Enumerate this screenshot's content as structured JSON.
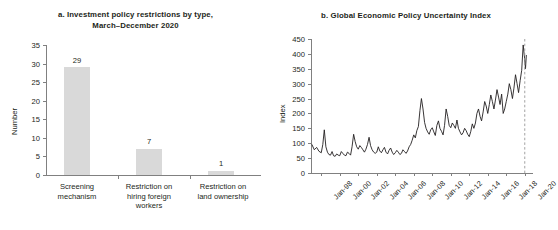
{
  "figure": {
    "panel_a": {
      "title_line1": "a. Investment policy restrictions by type,",
      "title_line2": "March–December 2020"
    },
    "panel_b": {
      "title": "b. Global Economic Policy Uncertainty Index"
    }
  },
  "chart_data": [
    {
      "type": "bar",
      "panel": "a",
      "title": "a. Investment policy restrictions by type, March–December 2020",
      "xlabel": "",
      "ylabel": "Number",
      "ylim": [
        0,
        35
      ],
      "yticks": [
        0,
        5,
        10,
        15,
        20,
        25,
        30,
        35
      ],
      "grid": false,
      "bar_color": "#d9d9d9",
      "categories": [
        [
          "Screening",
          "mechanism"
        ],
        [
          "Restriction on",
          "hiring foreign",
          "workers"
        ],
        [
          "Restriction on",
          "land ownership"
        ]
      ],
      "category_labels": [
        "Screening mechanism",
        "Restriction on hiring foreign workers",
        "Restriction on land ownership"
      ],
      "values": [
        29,
        7,
        1
      ],
      "value_labels": [
        "29",
        "7",
        "1"
      ]
    },
    {
      "type": "line",
      "panel": "b",
      "title": "b. Global Economic Policy Uncertainty Index",
      "xlabel": "",
      "ylabel": "Index",
      "ylim": [
        0,
        450
      ],
      "yticks": [
        0,
        50,
        100,
        150,
        200,
        250,
        300,
        350,
        400,
        450
      ],
      "xticks": [
        "Jan-98",
        "Jan-00",
        "Jan-02",
        "Jan-04",
        "Jan-06",
        "Jan-08",
        "Jan-10",
        "Jan-12",
        "Jan-14",
        "Jan-16",
        "Jan-18",
        "Jan-20"
      ],
      "xlim": [
        "Jan-97",
        "Jan-21"
      ],
      "grid": false,
      "line_color": "#231f20",
      "marker_line": {
        "x": "Jan-20",
        "style": "dashed",
        "color": "#999999"
      },
      "x": [
        1997.0,
        1997.25,
        1997.5,
        1997.75,
        1998.0,
        1998.17,
        1998.33,
        1998.5,
        1998.67,
        1998.83,
        1999.0,
        1999.17,
        1999.33,
        1999.5,
        1999.67,
        1999.83,
        2000.0,
        2000.17,
        2000.33,
        2000.5,
        2000.67,
        2000.83,
        2001.0,
        2001.17,
        2001.33,
        2001.5,
        2001.67,
        2001.83,
        2002.0,
        2002.17,
        2002.33,
        2002.5,
        2002.67,
        2002.83,
        2003.0,
        2003.17,
        2003.33,
        2003.5,
        2003.67,
        2003.83,
        2004.0,
        2004.17,
        2004.33,
        2004.5,
        2004.67,
        2004.83,
        2005.0,
        2005.17,
        2005.33,
        2005.5,
        2005.67,
        2005.83,
        2006.0,
        2006.17,
        2006.33,
        2006.5,
        2006.67,
        2006.83,
        2007.0,
        2007.17,
        2007.33,
        2007.5,
        2007.67,
        2007.83,
        2008.0,
        2008.17,
        2008.33,
        2008.5,
        2008.67,
        2008.83,
        2009.0,
        2009.17,
        2009.33,
        2009.5,
        2009.67,
        2009.83,
        2010.0,
        2010.17,
        2010.33,
        2010.5,
        2010.67,
        2010.83,
        2011.0,
        2011.17,
        2011.33,
        2011.5,
        2011.67,
        2011.83,
        2012.0,
        2012.17,
        2012.33,
        2012.5,
        2012.67,
        2012.83,
        2013.0,
        2013.17,
        2013.33,
        2013.5,
        2013.67,
        2013.83,
        2014.0,
        2014.17,
        2014.33,
        2014.5,
        2014.67,
        2014.83,
        2015.0,
        2015.17,
        2015.33,
        2015.5,
        2015.67,
        2015.83,
        2016.0,
        2016.17,
        2016.33,
        2016.5,
        2016.67,
        2016.83,
        2017.0,
        2017.17,
        2017.33,
        2017.5,
        2017.67,
        2017.83,
        2018.0,
        2018.17,
        2018.33,
        2018.5,
        2018.67,
        2018.83,
        2019.0,
        2019.17,
        2019.33,
        2019.5,
        2019.67,
        2019.83,
        2020.0,
        2020.08,
        2020.17,
        2020.25,
        2020.33,
        2020.42,
        2020.5
      ],
      "y": [
        95,
        78,
        86,
        73,
        68,
        96,
        145,
        88,
        70,
        62,
        60,
        72,
        58,
        56,
        64,
        60,
        58,
        72,
        66,
        60,
        58,
        70,
        66,
        60,
        88,
        130,
        105,
        88,
        80,
        92,
        86,
        78,
        70,
        80,
        96,
        120,
        92,
        78,
        70,
        66,
        70,
        88,
        74,
        68,
        78,
        86,
        70,
        64,
        76,
        84,
        70,
        62,
        68,
        76,
        70,
        62,
        66,
        78,
        72,
        66,
        74,
        88,
        96,
        110,
        128,
        118,
        142,
        156,
        210,
        250,
        215,
        170,
        150,
        138,
        130,
        145,
        152,
        138,
        126,
        160,
        175,
        150,
        140,
        128,
        160,
        215,
        190,
        160,
        152,
        168,
        160,
        150,
        178,
        150,
        138,
        128,
        135,
        150,
        142,
        130,
        122,
        140,
        165,
        150,
        168,
        200,
        215,
        190,
        175,
        205,
        240,
        225,
        200,
        230,
        262,
        240,
        215,
        245,
        280,
        255,
        230,
        265,
        200,
        215,
        240,
        265,
        300,
        280,
        250,
        285,
        330,
        300,
        270,
        310,
        345,
        430,
        380,
        350,
        395
      ]
    }
  ]
}
